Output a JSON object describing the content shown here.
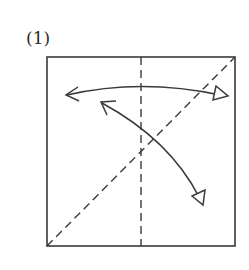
{
  "step": {
    "label": "(1)"
  },
  "colors": {
    "ink": "#3a3a3a",
    "background": "#ffffff"
  },
  "diagram": {
    "type": "origami-step",
    "paper": {
      "shape": "square",
      "x0": 47,
      "y0": 57,
      "x1": 235,
      "y1": 246
    },
    "creases": [
      {
        "name": "vertical-center-crease",
        "style": "valley-dashed",
        "from": [
          141,
          57
        ],
        "to": [
          141,
          246
        ]
      },
      {
        "name": "diagonal-crease",
        "style": "valley-dashed",
        "from": [
          47,
          246
        ],
        "to": [
          235,
          57
        ]
      }
    ],
    "arrows": [
      {
        "name": "horizontal-fold-unfold-arrow",
        "meaning": "fold in half and unfold",
        "from": [
          66,
          95
        ],
        "to": [
          228,
          95
        ],
        "start_head": "open-v",
        "end_head": "hollow-triangle"
      },
      {
        "name": "diagonal-fold-unfold-arrow",
        "meaning": "fold diagonally and unfold",
        "from": [
          101,
          102
        ],
        "to": [
          203,
          204
        ],
        "start_head": "open-v",
        "end_head": "hollow-triangle"
      }
    ]
  }
}
